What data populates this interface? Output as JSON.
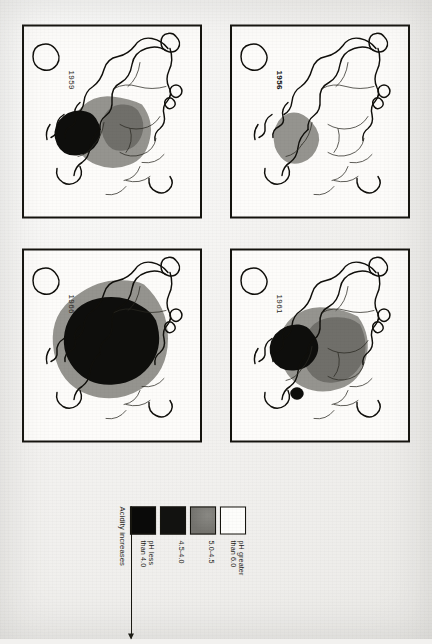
{
  "figure": {
    "kind": "map-series"
  },
  "legend": {
    "name": "pH legend",
    "entries": [
      {
        "id": "ph-above-6",
        "swatch": "white",
        "label": "pH greater\nthan 6.0",
        "color": "#fdfdfb"
      },
      {
        "id": "ph-5-45",
        "swatch": "gray",
        "label": "5.0-4.5",
        "color": "#7b7a76"
      },
      {
        "id": "ph-45-40",
        "swatch": "black",
        "label": "4.5-4.0",
        "color": "#121210"
      },
      {
        "id": "ph-below-4",
        "swatch": "darkest",
        "label": "pH less\nthan 4.0",
        "color": "#0a0a09"
      }
    ],
    "arrow_label": "Acidity increases"
  },
  "panels": [
    {
      "id": "panel-1956",
      "year": "1956",
      "bold": true,
      "zones": [
        "5.0-4.5"
      ]
    },
    {
      "id": "panel-1959",
      "year": "1959",
      "bold": false,
      "zones": [
        "5.0-4.5",
        "4.5-4.0"
      ]
    },
    {
      "id": "panel-1961",
      "year": "1961",
      "bold": false,
      "zones": [
        "5.0-4.5",
        "4.5-4.0"
      ]
    },
    {
      "id": "panel-1966",
      "year": "1966",
      "bold": false,
      "zones": [
        "5.0-4.5",
        "4.5-4.0"
      ]
    }
  ]
}
